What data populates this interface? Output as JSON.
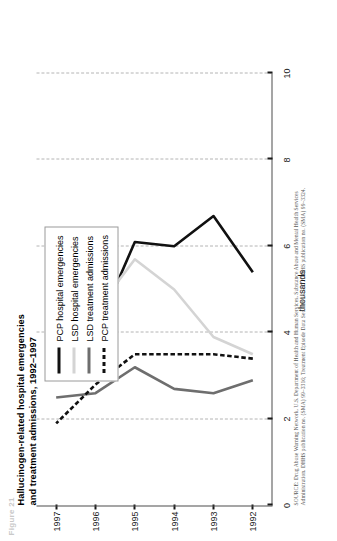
{
  "figure_label": "Figure 21",
  "title": {
    "line1": "Hallucinogen-related hospital emergencies",
    "line2": "and treatment admissions, 1992–1997"
  },
  "axis": {
    "y_title": "thousands",
    "y_ticks": [
      "0",
      "2",
      "4",
      "6",
      "8",
      "10"
    ],
    "x_ticks": [
      "1992",
      "1993",
      "1994",
      "1995",
      "1996",
      "1997"
    ]
  },
  "legend": {
    "items": [
      {
        "label": "PCP hospital emergencies",
        "color": "#111111",
        "style": "solid",
        "width": 2.6
      },
      {
        "label": "LSD  hospital emergencies",
        "color": "#d4d4d4",
        "style": "solid",
        "width": 2.6
      },
      {
        "label": "LSD treatment admissions",
        "color": "#6e6e6e",
        "style": "solid",
        "width": 2.6
      },
      {
        "label": "PCP treatment admissions",
        "color": "#111111",
        "style": "dashed",
        "width": 2.6
      }
    ]
  },
  "source": {
    "line1": "SOURCE: Drug Abuse Warning Network, U.S. Department of Health and Human Services, Substance Abuse and Mental Health Services",
    "line2": "Administration. DHHS publication no. (SMA) 99–3316; Treatment Episode Data Set: 1992–1997. DHHS publication no. (SMA) 99–3324."
  },
  "chart_data": {
    "type": "line",
    "title": "Hallucinogen-related hospital emergencies and treatment admissions, 1992–1997",
    "xlabel": "",
    "ylabel": "thousands",
    "categories": [
      "1992",
      "1993",
      "1994",
      "1995",
      "1996",
      "1997"
    ],
    "x": [
      1992,
      1993,
      1994,
      1995,
      1996,
      1997
    ],
    "ylim": [
      0,
      10
    ],
    "ytick_step": 2,
    "grid": "vertical-dashed-on-value-axis",
    "legend_position": "upper-left-inside",
    "orientation": "rotated-90-ccw",
    "series": [
      {
        "name": "PCP hospital emergencies",
        "color": "#111111",
        "style": "solid",
        "values": [
          5.4,
          6.7,
          6.0,
          6.1,
          4.0,
          4.0
        ]
      },
      {
        "name": "LSD  hospital emergencies",
        "color": "#d4d4d4",
        "style": "solid",
        "values": [
          3.5,
          3.9,
          5.0,
          5.7,
          4.5,
          5.0
        ]
      },
      {
        "name": "LSD treatment admissions",
        "color": "#6e6e6e",
        "style": "solid",
        "values": [
          2.9,
          2.6,
          2.7,
          3.2,
          2.6,
          2.5
        ]
      },
      {
        "name": "PCP treatment admissions",
        "color": "#111111",
        "style": "dashed",
        "values": [
          3.4,
          3.5,
          3.5,
          3.5,
          2.8,
          1.9
        ]
      }
    ]
  }
}
